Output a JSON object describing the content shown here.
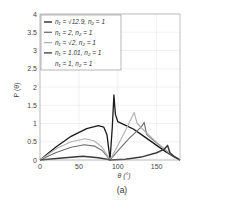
{
  "chart_data": {
    "type": "line",
    "title": "",
    "caption": "(a)",
    "xlabel": "θ (°)",
    "ylabel": "P (θ)",
    "xlim": [
      0,
      180
    ],
    "ylim": [
      0,
      4
    ],
    "xticks": [
      0,
      50,
      100,
      150
    ],
    "yticks": [
      0,
      0.5,
      1,
      1.5,
      2,
      2.5,
      3,
      3.5,
      4
    ],
    "grid": true,
    "legend_position": "upper-left",
    "series": [
      {
        "name": "n1 = √12.9, n2 = 1",
        "label_html": "n₁ = √12.9, n₂ = 1",
        "color": "#1a1a1a",
        "width": 1.3,
        "points": [
          [
            0,
            0
          ],
          [
            20,
            0.35
          ],
          [
            40,
            0.65
          ],
          [
            60,
            0.86
          ],
          [
            75,
            0.94
          ],
          [
            82,
            0.9
          ],
          [
            86,
            0.7
          ],
          [
            89,
            0.2
          ],
          [
            90,
            0
          ],
          [
            93,
            0.9
          ],
          [
            95,
            1.78
          ],
          [
            97,
            1.25
          ],
          [
            100,
            1.05
          ],
          [
            110,
            0.95
          ],
          [
            120,
            0.85
          ],
          [
            130,
            0.7
          ],
          [
            140,
            0.55
          ],
          [
            150,
            0.4
          ],
          [
            160,
            0.25
          ],
          [
            170,
            0.12
          ],
          [
            180,
            0
          ]
        ]
      },
      {
        "name": "n1 = 2, n2 = 1",
        "label_html": "n₁ = 2, n₂ = 1",
        "color": "#6e6e6e",
        "width": 1.1,
        "points": [
          [
            0,
            0
          ],
          [
            20,
            0.2
          ],
          [
            40,
            0.35
          ],
          [
            57,
            0.42
          ],
          [
            70,
            0.38
          ],
          [
            80,
            0.26
          ],
          [
            88,
            0.06
          ],
          [
            90,
            0
          ],
          [
            100,
            0.25
          ],
          [
            115,
            0.6
          ],
          [
            130,
            0.9
          ],
          [
            134,
            1.03
          ],
          [
            137,
            0.7
          ],
          [
            145,
            0.55
          ],
          [
            155,
            0.38
          ],
          [
            165,
            0.2
          ],
          [
            172,
            0.1
          ],
          [
            180,
            0
          ]
        ]
      },
      {
        "name": "n1 = √2, n2 = 1",
        "label_html": "n₁ = √2, n₂ = 1",
        "color": "#b0b0b0",
        "width": 1.1,
        "points": [
          [
            0,
            0
          ],
          [
            20,
            0.3
          ],
          [
            40,
            0.5
          ],
          [
            58,
            0.58
          ],
          [
            70,
            0.52
          ],
          [
            80,
            0.35
          ],
          [
            88,
            0.08
          ],
          [
            90,
            0
          ],
          [
            100,
            0.4
          ],
          [
            112,
            0.9
          ],
          [
            121,
            1.3
          ],
          [
            125,
            1.0
          ],
          [
            135,
            0.78
          ],
          [
            150,
            0.48
          ],
          [
            165,
            0.22
          ],
          [
            180,
            0
          ]
        ]
      },
      {
        "name": "n1 = 1.01, n2 = 1",
        "label_html": "n₁ = 1.01, n₂ = 1",
        "color": "#3a3a3a",
        "width": 1.5,
        "points": [
          [
            0,
            0
          ],
          [
            25,
            0.05
          ],
          [
            55,
            0.1
          ],
          [
            75,
            0.06
          ],
          [
            88,
            0.01
          ],
          [
            90,
            0
          ],
          [
            110,
            0.02
          ],
          [
            130,
            0.08
          ],
          [
            150,
            0.2
          ],
          [
            160,
            0.3
          ],
          [
            164,
            0.4
          ],
          [
            167,
            0.2
          ],
          [
            172,
            0.1
          ],
          [
            180,
            0
          ]
        ]
      },
      {
        "name": "n1 = 1, n2 = 1",
        "label_html": "n₁ = 1, n₂ = 1",
        "color": "#ffffff",
        "width": 0,
        "points": [
          [
            0,
            0
          ],
          [
            180,
            0
          ]
        ]
      }
    ]
  },
  "legend": {
    "items": [
      {
        "label": "n₁ = √12.9, n₂ = 1",
        "color": "#1a1a1a"
      },
      {
        "label": "n₁ = 2, n₂ = 1",
        "color": "#6e6e6e"
      },
      {
        "label": "n₁ = √2, n₂ = 1",
        "color": "#b0b0b0"
      },
      {
        "label": "n₁ = 1.01, n₂ = 1",
        "color": "#3a3a3a"
      },
      {
        "label": "n₁ = 1, n₂ = 1",
        "color": "none"
      }
    ]
  }
}
